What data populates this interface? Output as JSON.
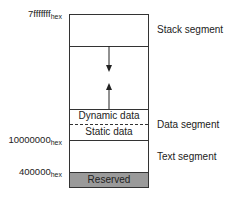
{
  "diagram": {
    "type": "memory-layout",
    "addresses": {
      "top": {
        "value": "7fffffff",
        "suffix": "hex"
      },
      "data_start": {
        "value": "10000000",
        "suffix": "hex"
      },
      "text_start": {
        "value": "400000",
        "suffix": "hex"
      }
    },
    "regions": {
      "dynamic": "Dynamic data",
      "static": "Static data",
      "reserved": "Reserved"
    },
    "segments": {
      "stack": "Stack segment",
      "data": "Data segment",
      "text": "Text segment"
    },
    "colors": {
      "reserved_fill": "#999999",
      "line": "#333333"
    }
  }
}
